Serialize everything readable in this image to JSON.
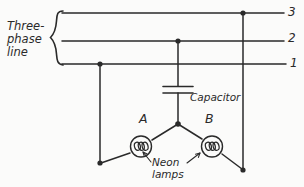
{
  "diagram": {
    "background_color": "#fbfbfa",
    "ink_color": "#2a2a2a",
    "labels": {
      "three_phase_line": "Three-\nphase\nline",
      "three_phase_line_l1": "Three-",
      "three_phase_line_l2": "phase",
      "three_phase_line_l3": "line",
      "line_3": "3",
      "line_2": "2",
      "line_1": "1",
      "capacitor": "Capacitor",
      "node_a": "A",
      "node_b": "B",
      "neon_lamps_l1": "Neon",
      "neon_lamps_l2": "lamps"
    },
    "components": [
      {
        "name": "capacitor",
        "type": "capacitor",
        "label": "Capacitor",
        "connected_to": [
          "line_2",
          "wye_node"
        ]
      },
      {
        "name": "neon-lamp-a",
        "type": "neon-lamp",
        "label": "A",
        "connected_to": [
          "wye_node",
          "line_1"
        ]
      },
      {
        "name": "neon-lamp-b",
        "type": "neon-lamp",
        "label": "B",
        "connected_to": [
          "wye_node",
          "line_3"
        ]
      }
    ],
    "conductors": [
      {
        "name": "line_3",
        "label": "3",
        "y": 13
      },
      {
        "name": "line_2",
        "label": "2",
        "y": 41
      },
      {
        "name": "line_1",
        "label": "1",
        "y": 64
      }
    ],
    "junctions": [
      {
        "name": "junction-line1",
        "x": 100,
        "y": 64
      },
      {
        "name": "junction-line2",
        "x": 178,
        "y": 41
      },
      {
        "name": "junction-line3",
        "x": 243,
        "y": 13
      },
      {
        "name": "wye-node",
        "x": 178,
        "y": 124
      },
      {
        "name": "terminal-left",
        "x": 100,
        "y": 163
      },
      {
        "name": "terminal-right",
        "x": 243,
        "y": 170
      }
    ]
  }
}
